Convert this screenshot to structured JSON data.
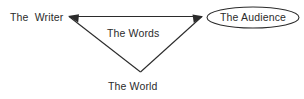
{
  "diagram": {
    "type": "triangle-relationship-diagram",
    "background_color": "#ffffff",
    "stroke_color": "#2b2b2b",
    "text_color": "#2b2b2b",
    "nodes": [
      {
        "id": "writer",
        "label": "The  Writer",
        "shape": "none",
        "position": "top-left"
      },
      {
        "id": "words",
        "label": "The Words",
        "shape": "none",
        "position": "center"
      },
      {
        "id": "world",
        "label": "The World",
        "shape": "none",
        "position": "bottom-center"
      },
      {
        "id": "audience",
        "label": "The Audience",
        "shape": "ellipse",
        "position": "top-right"
      }
    ],
    "edges": [
      {
        "from": "audience",
        "to": "writer",
        "style": "line",
        "arrowhead": "at-writer"
      },
      {
        "from": "world",
        "to": "audience",
        "style": "line",
        "arrowhead": "at-audience"
      },
      {
        "from": "writer",
        "to": "world",
        "style": "line",
        "arrowhead": "none"
      }
    ]
  }
}
